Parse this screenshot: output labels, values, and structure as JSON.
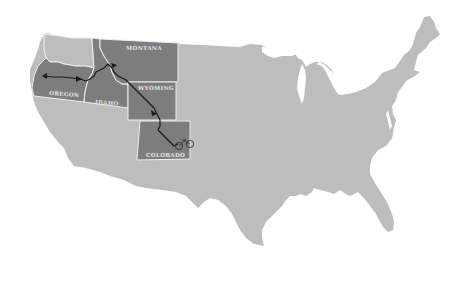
{
  "map": {
    "title": "United States route map",
    "colors": {
      "background": "#ffffff",
      "land": "#bdbdbd",
      "highlighted_state": "#7d7d7d",
      "state_border": "#efefef",
      "route": "#1a1a1a"
    },
    "highlighted_states": [
      {
        "id": "oregon",
        "label": "OREGON"
      },
      {
        "id": "idaho",
        "label": "IDAHO"
      },
      {
        "id": "montana",
        "label": "MONTANA"
      },
      {
        "id": "wyoming",
        "label": "WYOMING"
      },
      {
        "id": "colorado",
        "label": "COLORADO"
      }
    ],
    "other_states": [
      {
        "id": "washington"
      }
    ],
    "route": {
      "description": "Route from Oregon coast through Idaho, Montana, Wyoming to Colorado",
      "markers": [
        {
          "type": "start-arrow",
          "state": "oregon"
        },
        {
          "type": "direction-arrow",
          "state": "oregon"
        },
        {
          "type": "direction-arrow",
          "state": "montana"
        },
        {
          "type": "direction-arrow",
          "state": "wyoming"
        },
        {
          "type": "bicycle",
          "state": "colorado"
        }
      ]
    }
  }
}
